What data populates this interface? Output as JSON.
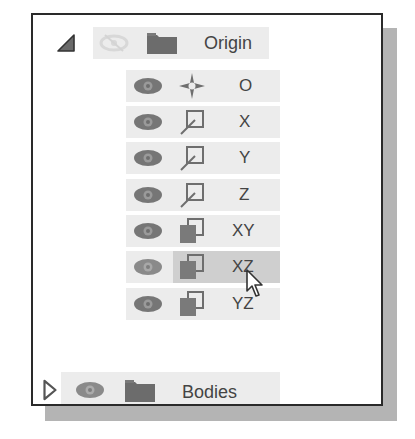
{
  "browser": {
    "folders": [
      {
        "label": "Origin",
        "expanded": true,
        "visibility": "hidden",
        "icon": "folder-icon",
        "toggle_icon": "collapse-triangle-icon"
      },
      {
        "label": "Bodies",
        "expanded": false,
        "visibility": "visible",
        "icon": "folder-icon",
        "toggle_icon": "expand-triangle-icon"
      }
    ],
    "origin_items": [
      {
        "label": "O",
        "type": "point",
        "icon": "origin-point-icon",
        "visibility": "visible"
      },
      {
        "label": "X",
        "type": "axis",
        "icon": "axis-icon",
        "visibility": "visible"
      },
      {
        "label": "Y",
        "type": "axis",
        "icon": "axis-icon",
        "visibility": "visible"
      },
      {
        "label": "Z",
        "type": "axis",
        "icon": "axis-icon",
        "visibility": "visible"
      },
      {
        "label": "XY",
        "type": "plane",
        "icon": "plane-icon",
        "visibility": "visible"
      },
      {
        "label": "XZ",
        "type": "plane",
        "icon": "plane-icon",
        "visibility": "visible",
        "hovered": true
      },
      {
        "label": "YZ",
        "type": "plane",
        "icon": "plane-icon",
        "visibility": "visible"
      }
    ]
  },
  "colors": {
    "row_bg": "#ececec",
    "row_hover": "#cfcfcf",
    "icon_gray": "#6e6e6e",
    "text": "#444444",
    "border": "#2a2a2a",
    "shadow": "#b4b4b4"
  }
}
